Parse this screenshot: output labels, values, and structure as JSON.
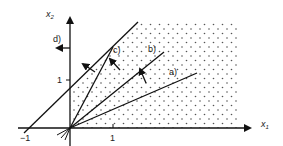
{
  "diagram": {
    "axes": {
      "x_label": "x",
      "x_sub": "1",
      "y_label": "x",
      "y_sub": "2",
      "x_ticks": [
        {
          "value": -1,
          "label": "−1"
        },
        {
          "value": 1,
          "label": "1"
        }
      ],
      "y_ticks": [
        {
          "value": 1,
          "label": "1"
        }
      ]
    },
    "region": {
      "fill": "dotted",
      "description": "feasible region right of line d and above x1 axis"
    },
    "lines": [
      {
        "id": "a",
        "label": "a)"
      },
      {
        "id": "b",
        "label": "b)"
      },
      {
        "id": "c",
        "label": "c)"
      },
      {
        "id": "d",
        "label": "d)"
      }
    ],
    "colors": {
      "stroke": "#1a1a1a",
      "dots": "#555555",
      "background": "#ffffff"
    }
  }
}
